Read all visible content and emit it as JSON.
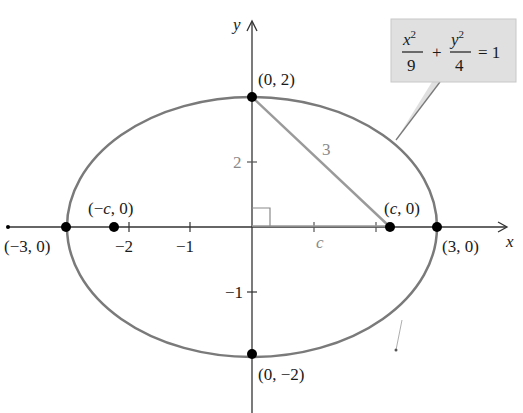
{
  "diagram": {
    "title_equation": {
      "x_term_num": "x",
      "x_term_exp": "2",
      "x_term_den": "9",
      "plus": "+",
      "y_term_num": "y",
      "y_term_exp": "2",
      "y_term_den": "4",
      "rhs": "= 1"
    },
    "axes": {
      "x_label": "x",
      "y_label": "y"
    },
    "ticks": {
      "x": [
        {
          "value": -2,
          "label": "−2"
        },
        {
          "value": -1,
          "label": "−1"
        },
        {
          "value": 1,
          "label": ""
        },
        {
          "value": 2,
          "label": ""
        }
      ],
      "y": [
        {
          "value": 2,
          "label": "2"
        },
        {
          "value": -1,
          "label": "−1"
        }
      ]
    },
    "points": [
      {
        "name": "top-vertex",
        "label": "(0, 2)"
      },
      {
        "name": "bottom-vertex",
        "label": "(0, −2)"
      },
      {
        "name": "left-vertex",
        "label": "(−3, 0)"
      },
      {
        "name": "right-vertex",
        "label": "(3, 0)"
      },
      {
        "name": "left-focus",
        "label_pre": "(−",
        "label_var": "c",
        "label_post": ", 0)"
      },
      {
        "name": "right-focus",
        "label_pre": "(",
        "label_var": "c",
        "label_post": ", 0)"
      }
    ],
    "triangle": {
      "hypotenuse_label": "3",
      "vertical_leg_label": "2",
      "horizontal_leg_label": "c"
    },
    "colors": {
      "ellipse": "#7a7a7a",
      "axes": "#333333",
      "triangle": "#9a9a9a",
      "callout_bg": "#e0e0e0",
      "point": "#000000"
    }
  }
}
